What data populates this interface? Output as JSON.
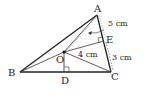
{
  "diagram": {
    "type": "triangle-geometry",
    "points": {
      "A": {
        "label": "A",
        "x": 97,
        "y": 15
      },
      "B": {
        "label": "B",
        "x": 20,
        "y": 72
      },
      "C": {
        "label": "C",
        "x": 111,
        "y": 72
      },
      "O": {
        "label": "O",
        "x": 64,
        "y": 52
      },
      "D": {
        "label": "D",
        "x": 64,
        "y": 72
      },
      "E": {
        "label": "E",
        "x": 104,
        "y": 41
      }
    },
    "measurements": {
      "AE": "5 cm",
      "OE": "4 cm",
      "EC": "3 cm"
    }
  }
}
